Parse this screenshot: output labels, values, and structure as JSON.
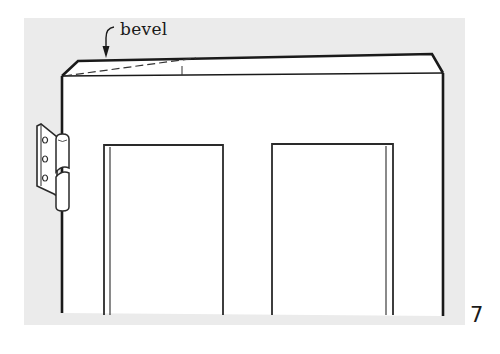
{
  "figure": {
    "label": "bevel",
    "number": "7",
    "colors": {
      "background_shade": "#ebebeb",
      "line": "#1a1a1a",
      "paper": "#ffffff"
    }
  }
}
